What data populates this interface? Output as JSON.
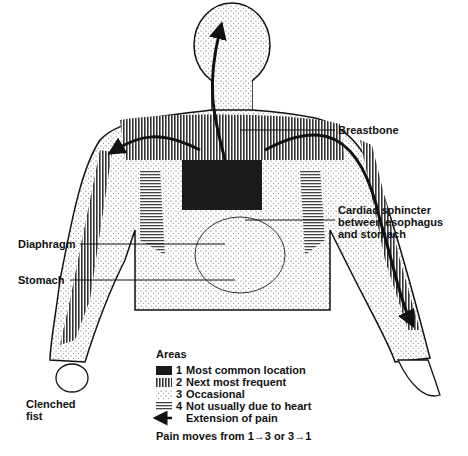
{
  "labels": {
    "breastbone": "Breastbone",
    "cardiac_sphincter": [
      "Cardiac sphincter",
      "between esophagus",
      "and stomach"
    ],
    "diaphragm": "Diaphragm",
    "stomach": "Stomach",
    "clenched_fist": [
      "Clenched",
      "fist"
    ]
  },
  "legend": {
    "title": "Areas",
    "items": [
      {
        "num": "1",
        "text": "Most common location",
        "pattern": "solid"
      },
      {
        "num": "2",
        "text": "Next most frequent",
        "pattern": "vertical-lines"
      },
      {
        "num": "3",
        "text": "Occasional",
        "pattern": "dots"
      },
      {
        "num": "4",
        "text": "Not usually due to heart",
        "pattern": "horizontal-lines"
      },
      {
        "num": "",
        "text": "Extension of pain",
        "pattern": "arrow"
      }
    ],
    "footer": "Pain moves from 1→3 or 3→1"
  }
}
